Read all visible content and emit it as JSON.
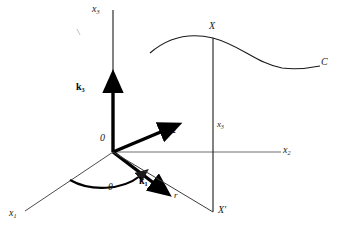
{
  "figure": {
    "type": "3d-coordinate-diagram",
    "background_color": "#ffffff",
    "ink_color": "#1a1a1a",
    "bold_ink_color": "#000000"
  },
  "axes": {
    "x3": {
      "label": "x",
      "sub": "3",
      "orientation": "vertical-up"
    },
    "x2": {
      "label": "x",
      "sub": "2",
      "orientation": "horizontal-right"
    },
    "x1": {
      "label": "x",
      "sub": "1",
      "orientation": "diagonal-down-left"
    }
  },
  "origin": {
    "label": "0"
  },
  "basis_vectors": [
    {
      "label": "k",
      "sub": "1",
      "direction": "down-right",
      "style": "bold-arrow"
    },
    {
      "label": "k",
      "sub": "2",
      "direction": "up-right",
      "style": "bold-arrow"
    },
    {
      "label": "k",
      "sub": "3",
      "direction": "up",
      "style": "bold-arrow"
    }
  ],
  "angle": {
    "label": "θ",
    "between": "x1-axis and k1"
  },
  "points": {
    "X": {
      "label": "X",
      "note": "point on curve C"
    },
    "X_prime": {
      "label": "X′",
      "note": "projection of X onto the x1-x2 plane"
    }
  },
  "segments": {
    "vertical_height": {
      "label": "x",
      "sub": "3"
    },
    "radial": {
      "label": "r"
    }
  },
  "curve": {
    "label": "C"
  }
}
